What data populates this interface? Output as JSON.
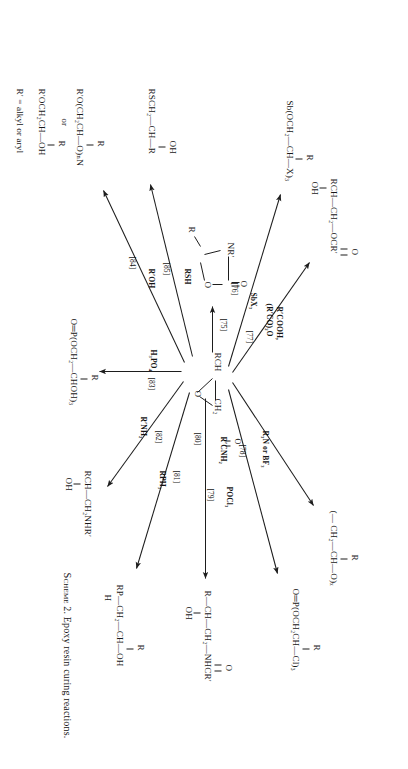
{
  "figure": {
    "caption_label": "Scheme",
    "caption_number": "2.",
    "caption_text": "Epoxy resin curing reactions."
  },
  "center": {
    "name": "epoxide",
    "left_group": "RCH",
    "right_group": "CH₂",
    "ring_atom": "O"
  },
  "reactions": [
    {
      "id": "75",
      "ref": "[75]",
      "reagent": "",
      "product_name": "oxazolidinone",
      "product_parts": {
        "n_label": "NR′",
        "carbonyl_o": "O",
        "ring_o": "O",
        "r_label": "R"
      }
    },
    {
      "id": "76",
      "ref": "[76]",
      "reagent": "SbX₃",
      "product_name": "antimony-trialkoxide",
      "product_text": "Sb(OCH₂—CH—X)₃",
      "product_sub": "R"
    },
    {
      "id": "77",
      "ref": "[77]",
      "reagent_line1": "R′COOH,",
      "reagent_line2": "(R′CO)₂O",
      "product_name": "hydroxy-ester",
      "product_text": "RCH—CH₂—OCR′",
      "product_oh": "OH",
      "product_carbonyl": "O"
    },
    {
      "id": "78",
      "ref": "[78]",
      "reagent": "R₃N or BF₃",
      "product_name": "polyether",
      "product_text": "(— CH₂—CH—O)ₓ",
      "product_sub": "R"
    },
    {
      "id": "79",
      "ref": "[79]",
      "reagent": "POCl₃",
      "product_name": "phosphate-chlorohydrin",
      "product_text": "O═P(OCH₂CH—Cl)₃",
      "product_sub": "R"
    },
    {
      "id": "80",
      "ref": "[80]",
      "reagent": "R′CNH₂",
      "reagent_carbonyl": "O",
      "product_name": "hydroxy-amide",
      "product_text": "R—CH—CH₂—NHCR′",
      "product_oh": "OH",
      "product_carbonyl": "O"
    },
    {
      "id": "81",
      "ref": "[81]",
      "reagent": "RPH₃",
      "product_name": "phosphonium-adduct",
      "product_text": "RP—CH₂—CH—OH",
      "product_sub": "R",
      "product_sub2": "H"
    },
    {
      "id": "82",
      "ref": "[82]",
      "reagent": "R′NH₂",
      "product_name": "amino-alcohol",
      "product_text": "RCH—CH₂NHR′",
      "product_oh": "OH"
    },
    {
      "id": "83",
      "ref": "[83]",
      "reagent": "H₃PO₄",
      "product_name": "phosphate-triester",
      "product_text": "O═P(OCH₂—CHOH)₃",
      "product_sub": "R"
    },
    {
      "id": "84",
      "ref": "[84]",
      "reagent": "R′OH",
      "product_name": "glycol-ether",
      "product_text": "R′O(CH₂CH—O)ₙN",
      "product_sub": "R",
      "product_or": "or",
      "product_text2": "R′OCH₂CH—OH",
      "product_sub_b": "R",
      "product_note": "R′ = alkyl or aryl"
    },
    {
      "id": "85",
      "ref": "[85]",
      "reagent": "RSH",
      "product_name": "hydroxy-thioether",
      "product_text": "RSCH₂—CH—R",
      "product_oh": "OH"
    }
  ],
  "colors": {
    "ink": "#171717",
    "paper": "#ffffff"
  }
}
